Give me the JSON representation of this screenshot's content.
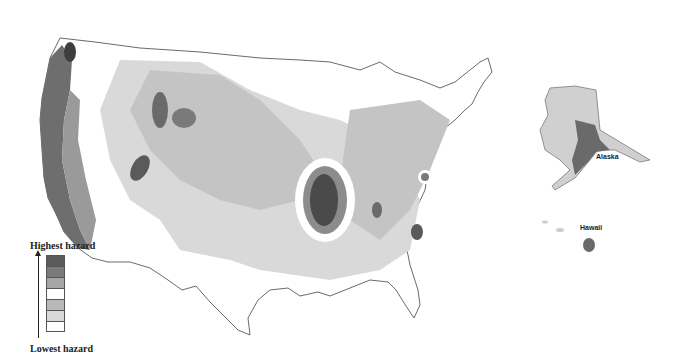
{
  "legend": {
    "top_label": "Highest hazard",
    "bottom_label": "Lowest hazard",
    "swatches": [
      {
        "level": 7,
        "color": "#5a5a5a"
      },
      {
        "level": 6,
        "color": "#7a7a7a"
      },
      {
        "level": 5,
        "color": "#a6a6a6"
      },
      {
        "level": 4,
        "color": "#ffffff"
      },
      {
        "level": 3,
        "color": "#b8b8b8"
      },
      {
        "level": 2,
        "color": "#d8d8d8"
      },
      {
        "level": 1,
        "color": "#ffffff"
      }
    ]
  },
  "labels": {
    "alaska": "Alaska",
    "hawaii": "Hawaii"
  },
  "colors": {
    "lowest": "#ffffff",
    "low": "#d9d9d9",
    "mid": "#bdbdbd",
    "high": "#8c8c8c",
    "highest": "#555555",
    "border": "#444444"
  }
}
